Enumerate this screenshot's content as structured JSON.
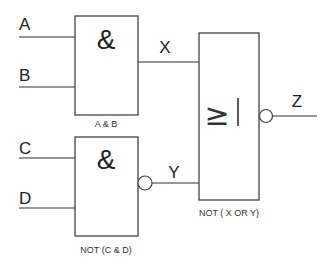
{
  "diagram": {
    "type": "logic-gate-circuit",
    "inputs": [
      {
        "name": "A"
      },
      {
        "name": "B"
      },
      {
        "name": "C"
      },
      {
        "name": "D"
      }
    ],
    "gates": [
      {
        "id": "and1",
        "symbol": "&",
        "inputs": [
          "A",
          "B"
        ],
        "output": "X",
        "inverted_output": false,
        "caption": "A & B"
      },
      {
        "id": "nand1",
        "symbol": "&",
        "inputs": [
          "C",
          "D"
        ],
        "output": "Y",
        "inverted_output": true,
        "caption": "NOT (C & D)"
      },
      {
        "id": "nor1",
        "symbol": "≥",
        "symbol_bar": "|",
        "inputs": [
          "X",
          "Y"
        ],
        "output": "Z",
        "inverted_output": true,
        "caption": "NOT ( X OR Y)"
      }
    ],
    "signals": {
      "x": "X",
      "y": "Y",
      "z": "Z"
    },
    "colors": {
      "stroke": "#444444",
      "text": "#222222",
      "background": "#ffffff"
    }
  }
}
